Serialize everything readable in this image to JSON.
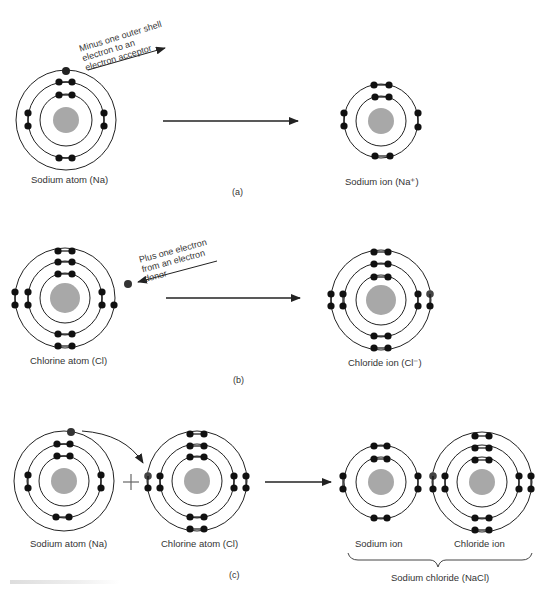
{
  "panels": {
    "a": {
      "label": "(a)",
      "left_caption": "Sodium atom (Na)",
      "right_caption": "Sodium ion (Na⁺)",
      "annotation": [
        "Minus one outer shell",
        "electron to an",
        "electron acceptor"
      ]
    },
    "b": {
      "label": "(b)",
      "left_caption": "Chlorine atom (Cl)",
      "right_caption": "Chloride ion (Cl⁻)",
      "annotation": [
        "Plus one electron",
        "from an electron",
        "donor"
      ]
    },
    "c": {
      "label": "(c)",
      "sodium_atom_caption": "Sodium atom (Na)",
      "chlorine_atom_caption": "Chlorine atom (Cl)",
      "plus_sign": "+",
      "sodium_ion_caption": "Sodium ion",
      "chloride_ion_caption": "Chloride ion",
      "compound_caption": "Sodium chloride (NaCl)"
    }
  },
  "colors": {
    "nucleus": "#a8a8a8",
    "electron": "#111111",
    "transferred_electron": "#444444",
    "shell": "#222222"
  }
}
